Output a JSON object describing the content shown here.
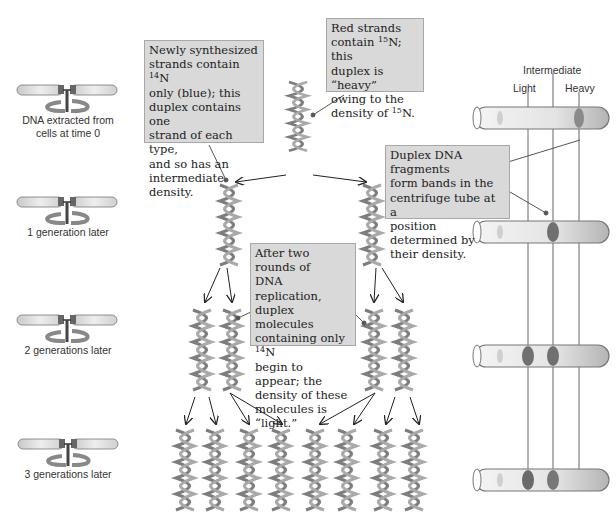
{
  "figure": {
    "generations": [
      {
        "id": "g0",
        "label": "DNA extracted from\ncells at time 0",
        "tube_bands": [
          "heavy"
        ]
      },
      {
        "id": "g1",
        "label": "1 generation later",
        "tube_bands": [
          "intermediate"
        ]
      },
      {
        "id": "g2",
        "label": "2 generations later",
        "tube_bands": [
          "light",
          "intermediate"
        ]
      },
      {
        "id": "g3",
        "label": "3 generations later",
        "tube_bands": [
          "light",
          "intermediate"
        ]
      }
    ],
    "density_labels": {
      "intermediate": "Intermediate",
      "light": "Light",
      "heavy": "Heavy"
    },
    "callouts": {
      "heavy": {
        "pre": "Red strands\ncontain ",
        "iso": "15",
        "post": "N; this\nduplex is “heavy”\nowing to the\ndensity of ",
        "iso2": "15",
        "post2": "N."
      },
      "intermediate": {
        "pre": "Newly synthesized\nstrands contain ",
        "iso": "14",
        "post": "N\nonly (blue); this\nduplex contains one\nstrand of each type,\nand so has an\nintermediate density."
      },
      "bands": {
        "text": "Duplex DNA fragments\nform bands in the\ncentrifuge tube at a\nposition determined by\ntheir density."
      },
      "light": {
        "pre": "After two rounds of\nDNA replication,\nduplex molecules\ncontaining only ",
        "iso": "14",
        "post": "N\nbegin to appear; the\ndensity of these\nmolecules is “light.”"
      }
    },
    "helix_counts_per_generation": [
      1,
      2,
      4,
      8
    ],
    "colors": {
      "note_bg": "#d9d9d9",
      "note_border": "#a8a8a8",
      "helix": "#7a7a7a",
      "band_dark": "#6e6e6e",
      "line": "#555555"
    }
  }
}
